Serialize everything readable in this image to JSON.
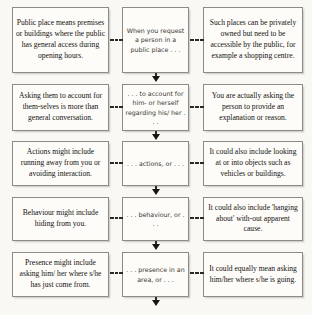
{
  "diagram": {
    "background_color": "#faf8f4",
    "box_border_color": "#8d8b86",
    "connector_color": "#2b2926",
    "rows": [
      {
        "left": "Public place means premises or buildings where the public has general access during opening hours.",
        "middle": "When you request a person in a public place . . .",
        "right": "Such places can be privately owned but need to be accessible by the public, for example a shopping centre."
      },
      {
        "left": "Asking them to account for them-selves is more than general conversation.",
        "middle": ". . . to account for him- or herself regarding his/ her . . .",
        "right": "You are actually asking the person to provide an explanation or reason."
      },
      {
        "left": "Actions might include running away from you or avoiding interaction.",
        "middle": ". . . actions, or . . .",
        "right": "It could also include looking at or into objects such as vehicles or buildings."
      },
      {
        "left": "Behaviour might include hiding from you.",
        "middle": ". . . behaviour, or . . .",
        "right": "It could also include 'hanging about' with-out apparent cause."
      },
      {
        "left": "Presence might include asking him/ her where s/he has just come from.",
        "middle": ". . . presence in an area, or . . .",
        "right": "It could equally mean asking him/her where s/he is going."
      }
    ],
    "connectors": {
      "dash_label": "dashed-link",
      "arrow_label": "down-arrow"
    }
  }
}
